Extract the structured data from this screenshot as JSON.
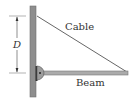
{
  "diagram": {
    "labels": {
      "cable": "Cable",
      "beam": "Beam",
      "dimension": "D"
    },
    "colors": {
      "wall": "#8c8c8c",
      "wall_edge": "#6f6f6f",
      "beam": "#a8a8a8",
      "beam_edge": "#7a7a7a",
      "cable": "#555555",
      "hinge": "#9a9a9a",
      "text": "#333333",
      "dimension": "#444444"
    }
  }
}
